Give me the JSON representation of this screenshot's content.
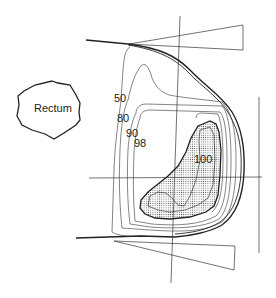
{
  "diagram": {
    "type": "isodose-distribution",
    "organ_label": "Rectum",
    "isodose_labels": [
      {
        "value": "50"
      },
      {
        "value": "80"
      },
      {
        "value": "90"
      },
      {
        "value": "98"
      },
      {
        "value": "100"
      }
    ],
    "colors": {
      "line": "#222222",
      "stipple": "#555555",
      "background": "#ffffff"
    }
  }
}
